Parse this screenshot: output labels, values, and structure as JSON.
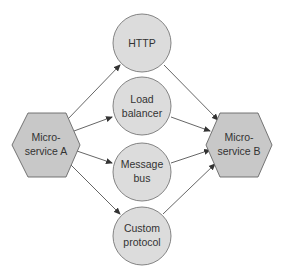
{
  "colors": {
    "node_fill": "#dcdcdc",
    "hex_fill": "#c8c8c8",
    "stroke": "#666666",
    "arrow": "#333333",
    "text": "#333333"
  },
  "nodes": {
    "service_a": {
      "line1": "Micro-",
      "line2": "service A"
    },
    "service_b": {
      "line1": "Micro-",
      "line2": "service B"
    },
    "http": {
      "line1": "HTTP"
    },
    "load_balancer": {
      "line1": "Load",
      "line2": "balancer"
    },
    "message_bus": {
      "line1": "Message",
      "line2": "bus"
    },
    "custom_protocol": {
      "line1": "Custom",
      "line2": "protocol"
    }
  },
  "edges": [
    {
      "from": "Micro-service A",
      "to": "HTTP"
    },
    {
      "from": "Micro-service A",
      "to": "Load balancer"
    },
    {
      "from": "Micro-service A",
      "to": "Message bus"
    },
    {
      "from": "Micro-service A",
      "to": "Custom protocol"
    },
    {
      "from": "HTTP",
      "to": "Micro-service B"
    },
    {
      "from": "Load balancer",
      "to": "Micro-service B"
    },
    {
      "from": "Message bus",
      "to": "Micro-service B"
    },
    {
      "from": "Custom protocol",
      "to": "Micro-service B"
    }
  ]
}
